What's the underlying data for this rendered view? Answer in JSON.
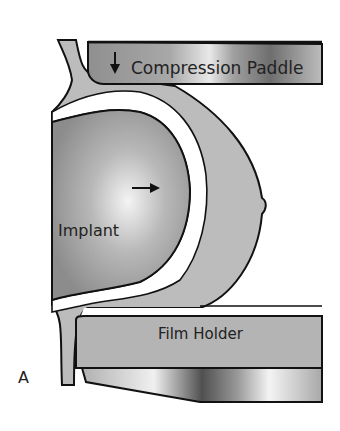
{
  "figure": {
    "panel_label": "A",
    "labels": {
      "compression_paddle": "Compression Paddle",
      "implant": "Implant",
      "film_holder": "Film Holder"
    },
    "arrows": {
      "paddle_direction": "down",
      "implant_direction": "right"
    },
    "colors": {
      "implant_center": "#f2f2f2",
      "implant_edge": "#8a8a8a",
      "breast_tissue": "#b9b9b9",
      "paddle": "#9a9a9a",
      "film_holder": "#b4b4b4",
      "outline": "#111111",
      "capsule": "#ffffff"
    }
  }
}
